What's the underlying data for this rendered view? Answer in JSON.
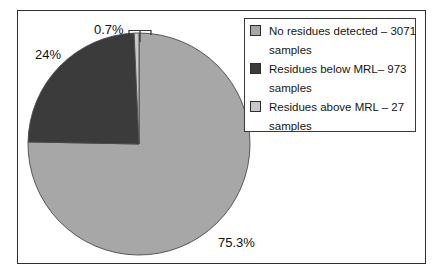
{
  "chart_data": {
    "type": "pie",
    "start_angle_deg": 0,
    "direction": "clockwise",
    "slices": [
      {
        "label": "No residues detected",
        "samples": 3071,
        "percent": 75.3,
        "datalabel": "75.3%",
        "color": "#a7a7a7"
      },
      {
        "label": "Residues below MRL",
        "samples": 973,
        "percent": 24,
        "datalabel": "24%",
        "color": "#3b3b3b"
      },
      {
        "label": "Residues above MRL",
        "samples": 27,
        "percent": 0.7,
        "datalabel": "0.7%",
        "color": "#c9c9c9"
      }
    ],
    "outline_color": "#4a4a4a",
    "legend": {
      "position": "top-right",
      "entries": [
        {
          "lines": [
            "No residues detected – 3071",
            "samples"
          ]
        },
        {
          "lines": [
            "Residues below MRL– 973",
            "samples"
          ]
        },
        {
          "lines": [
            "Residues above MRL – 27",
            "samples"
          ]
        }
      ]
    }
  }
}
